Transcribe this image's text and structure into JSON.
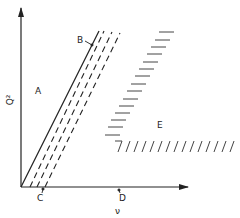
{
  "diagram": {
    "axes": {
      "y_label": "Q²",
      "x_label": "ν"
    },
    "region_labels": {
      "A": "A",
      "B": "B",
      "C": "C",
      "D": "D",
      "E": "E"
    },
    "colors": {
      "ink": "#222222",
      "background": "#ffffff"
    }
  }
}
